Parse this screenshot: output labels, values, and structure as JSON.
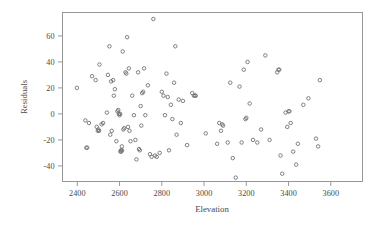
{
  "chart_data": {
    "type": "scatter",
    "title": "",
    "xlabel": "Elevation",
    "ylabel": "Residuals",
    "xlim": [
      2330,
      3750
    ],
    "ylim": [
      -52,
      78
    ],
    "xticks": [
      2400,
      2600,
      2800,
      3000,
      3200,
      3400,
      3600
    ],
    "xtick_labels": [
      "2400",
      "2600",
      "2800",
      "3000",
      "3200",
      "3400",
      "3600"
    ],
    "yticks": [
      -40,
      -20,
      0,
      20,
      40,
      60
    ],
    "ytick_labels": [
      "-40",
      "-20",
      "0",
      "20",
      "40",
      "60"
    ],
    "grid": false,
    "legend": null,
    "marker": "open-circle",
    "marker_color": "#6b6b6b",
    "frame_color": "#8d8d8d",
    "points": [
      [
        2398,
        20
      ],
      [
        2438,
        -5
      ],
      [
        2443,
        -26
      ],
      [
        2447,
        -26
      ],
      [
        2455,
        -7
      ],
      [
        2470,
        29
      ],
      [
        2487,
        26
      ],
      [
        2492,
        -10
      ],
      [
        2497,
        -13
      ],
      [
        2500,
        -12
      ],
      [
        2503,
        -13
      ],
      [
        2505,
        38
      ],
      [
        2515,
        -8
      ],
      [
        2522,
        -7
      ],
      [
        2540,
        1
      ],
      [
        2545,
        30
      ],
      [
        2552,
        52
      ],
      [
        2556,
        -16
      ],
      [
        2560,
        25
      ],
      [
        2563,
        -13
      ],
      [
        2570,
        26
      ],
      [
        2573,
        14
      ],
      [
        2578,
        19
      ],
      [
        2585,
        -21
      ],
      [
        2590,
        2
      ],
      [
        2594,
        3
      ],
      [
        2597,
        0
      ],
      [
        2600,
        -1
      ],
      [
        2603,
        0
      ],
      [
        2604,
        -29
      ],
      [
        2607,
        -28
      ],
      [
        2608,
        -29
      ],
      [
        2611,
        -25
      ],
      [
        2612,
        -28
      ],
      [
        2615,
        48
      ],
      [
        2618,
        -12
      ],
      [
        2622,
        -11
      ],
      [
        2628,
        32
      ],
      [
        2632,
        31
      ],
      [
        2636,
        59
      ],
      [
        2640,
        -10
      ],
      [
        2644,
        35
      ],
      [
        2647,
        -13
      ],
      [
        2652,
        -21
      ],
      [
        2660,
        14
      ],
      [
        2668,
        -1
      ],
      [
        2675,
        -20
      ],
      [
        2680,
        -35
      ],
      [
        2688,
        32
      ],
      [
        2692,
        -27
      ],
      [
        2696,
        -28
      ],
      [
        2700,
        6
      ],
      [
        2703,
        -9
      ],
      [
        2707,
        16
      ],
      [
        2712,
        17
      ],
      [
        2716,
        35
      ],
      [
        2722,
        -1
      ],
      [
        2734,
        22
      ],
      [
        2744,
        -31
      ],
      [
        2752,
        -33
      ],
      [
        2760,
        73
      ],
      [
        2768,
        -32
      ],
      [
        2776,
        -33
      ],
      [
        2790,
        -30
      ],
      [
        2800,
        17
      ],
      [
        2808,
        14
      ],
      [
        2815,
        -1
      ],
      [
        2822,
        31
      ],
      [
        2828,
        13
      ],
      [
        2834,
        -28
      ],
      [
        2843,
        7
      ],
      [
        2850,
        -4
      ],
      [
        2858,
        24
      ],
      [
        2864,
        52
      ],
      [
        2870,
        -16
      ],
      [
        2880,
        11
      ],
      [
        2890,
        -7
      ],
      [
        2900,
        10
      ],
      [
        2920,
        -24
      ],
      [
        2944,
        16
      ],
      [
        2952,
        14
      ],
      [
        2958,
        14
      ],
      [
        2960,
        14
      ],
      [
        3008,
        -15
      ],
      [
        3062,
        -23
      ],
      [
        3072,
        -7
      ],
      [
        3080,
        -13
      ],
      [
        3086,
        -8
      ],
      [
        3090,
        -9
      ],
      [
        3112,
        -22
      ],
      [
        3124,
        24
      ],
      [
        3136,
        -34
      ],
      [
        3150,
        -49
      ],
      [
        3168,
        21
      ],
      [
        3178,
        -22
      ],
      [
        3188,
        34
      ],
      [
        3196,
        -4
      ],
      [
        3200,
        -3
      ],
      [
        3206,
        40
      ],
      [
        3216,
        8
      ],
      [
        3232,
        -20
      ],
      [
        3252,
        -22
      ],
      [
        3270,
        -12
      ],
      [
        3290,
        45
      ],
      [
        3310,
        -20
      ],
      [
        3346,
        32
      ],
      [
        3352,
        34
      ],
      [
        3356,
        34
      ],
      [
        3362,
        -32
      ],
      [
        3370,
        -46
      ],
      [
        3386,
        1
      ],
      [
        3394,
        -10
      ],
      [
        3400,
        2
      ],
      [
        3404,
        2
      ],
      [
        3410,
        -7
      ],
      [
        3422,
        -29
      ],
      [
        3436,
        -39
      ],
      [
        3444,
        -23
      ],
      [
        3470,
        7
      ],
      [
        3494,
        12
      ],
      [
        3530,
        -19
      ],
      [
        3540,
        -25
      ],
      [
        3548,
        26
      ]
    ]
  }
}
